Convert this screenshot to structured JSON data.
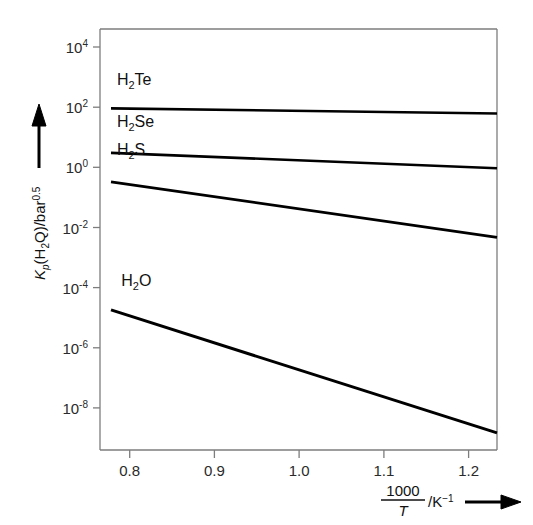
{
  "chart_data": {
    "type": "line",
    "title": "",
    "subtitle": "",
    "xlabel": "1000/T /K^-1",
    "ylabel": "K_p(H2Q)/bar^0.5",
    "xlabel_parts": {
      "numerator": "1000",
      "denominator": "T",
      "unit": "/K",
      "unit_exp": "−1",
      "arrow": "→"
    },
    "ylabel_parts": {
      "symbol": "K",
      "symbol_sub": "p",
      "open": "(H",
      "sub2": "2",
      "q": "Q)/bar",
      "exp": "0.5",
      "arrow": "↑"
    },
    "x": {
      "ticks": [
        0.8,
        0.9,
        1.0,
        1.1,
        1.2
      ],
      "ticklabels": [
        "0.8",
        "0.9",
        "1.0",
        "1.1",
        "1.2"
      ],
      "lim": [
        0.765,
        1.2335
      ],
      "scale": "linear",
      "grid": false
    },
    "y": {
      "ticks": [
        4,
        2,
        0,
        -2,
        -4,
        -6,
        -8
      ],
      "ticklabels": [
        "10^4",
        "10^2",
        "10^0",
        "10^-2",
        "10^-4",
        "10^-6",
        "10^-8"
      ],
      "tick_mantissa": "10",
      "tick_exponents": [
        "4",
        "2",
        "0",
        "-2",
        "-4",
        "-6",
        "-8"
      ],
      "lim": [
        -9.4,
        4.6
      ],
      "scale": "log10",
      "grid": false
    },
    "legend_position": "inline-labels",
    "series": [
      {
        "name": "H2Te",
        "label_parts": {
          "a": "H",
          "sub": "2",
          "b": "Te"
        },
        "label_x": 0.785,
        "label_y_log": 2.75,
        "points": [
          {
            "x": 0.778,
            "y_log": 1.96
          },
          {
            "x": 1.2335,
            "y_log": 1.79
          }
        ],
        "values_note": "K_p from ~9.1e1 at 1000/T=0.778 to ~6.2e1 at 1000/T=1.2335"
      },
      {
        "name": "H2Se",
        "label_parts": {
          "a": "H",
          "sub": "2",
          "b": "Se"
        },
        "label_x": 0.785,
        "label_y_log": 1.35,
        "points": [
          {
            "x": 0.778,
            "y_log": 0.48
          },
          {
            "x": 1.2335,
            "y_log": -0.03
          }
        ],
        "values_note": "K_p from ~3.0 at 1000/T=0.778 to ~0.93 at 1000/T=1.2335"
      },
      {
        "name": "H2S",
        "label_parts": {
          "a": "H",
          "sub": "2",
          "b": "S"
        },
        "label_x": 0.785,
        "label_y_log": 0.42,
        "points": [
          {
            "x": 0.778,
            "y_log": -0.48
          },
          {
            "x": 1.2335,
            "y_log": -2.33
          }
        ],
        "values_note": "K_p from ~0.33 at 1000/T=0.778 to ~4.7e-3 at 1000/T=1.2335"
      },
      {
        "name": "H2O",
        "label_parts": {
          "a": "H",
          "sub": "2",
          "b": "O"
        },
        "label_x": 0.79,
        "label_y_log": -3.95,
        "points": [
          {
            "x": 0.778,
            "y_log": -4.74
          },
          {
            "x": 1.2335,
            "y_log": -8.83
          }
        ],
        "values_note": "K_p from ~1.8e-5 at 1000/T=0.778 to ~1.5e-9 at 1000/T=1.2335"
      }
    ],
    "colors": {
      "curve": "#000000",
      "axis": "#7d7d7d",
      "text": "#1a1a1a",
      "background": "#ffffff"
    }
  }
}
